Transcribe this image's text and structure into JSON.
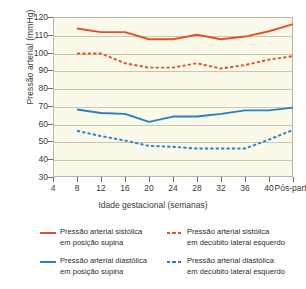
{
  "chart_data": {
    "type": "line",
    "title": "",
    "xlabel": "Idade gestacional (semanas)",
    "ylabel": "Pressão arterial (mmHg)",
    "xlim": [
      4,
      44
    ],
    "ylim": [
      30,
      120
    ],
    "ytick_step": 10,
    "grid": true,
    "legend_position": "bottom",
    "x_tick_labels": [
      "4",
      "8",
      "12",
      "16",
      "20",
      "24",
      "28",
      "32",
      "36",
      "40",
      "Pós-parto"
    ],
    "x_tick_values": [
      4,
      8,
      12,
      16,
      20,
      24,
      28,
      32,
      36,
      40,
      44
    ],
    "y_tick_labels": [
      "120",
      "110",
      "100",
      "90",
      "80",
      "70",
      "60",
      "50",
      "40",
      "30"
    ],
    "y_tick_values": [
      120,
      110,
      100,
      90,
      80,
      70,
      60,
      50,
      40,
      30
    ],
    "x": [
      8,
      12,
      16,
      20,
      24,
      28,
      32,
      36,
      40,
      44
    ],
    "series": [
      {
        "name": "Pressão arterial sistólica em posição supina",
        "name_line1": "Pressão arterial sistólica",
        "name_line2": "em posição supina",
        "color": "#e4502a",
        "style": "solid",
        "values": [
          113.5,
          111.5,
          111.5,
          107.5,
          107.5,
          110,
          107.5,
          109,
          112,
          116
        ]
      },
      {
        "name": "Pressão arterial sistólica em decúbito lateral esquerdo",
        "name_line1": "Pressão arterial sistólica",
        "name_line2": "em decúbito lateral esquerdo",
        "color": "#e4502a",
        "style": "dashed",
        "values": [
          99.5,
          99.5,
          94,
          91.5,
          91.5,
          94,
          91,
          93,
          96,
          98
        ]
      },
      {
        "name": "Pressão arterial diastólica em posição supina",
        "name_line1": "Pressão arterial diastólica",
        "name_line2": "em posição supina",
        "color": "#2a7fc4",
        "style": "solid",
        "values": [
          68,
          66,
          65.5,
          61,
          64,
          64,
          65.5,
          67.5,
          67.5,
          69
        ]
      },
      {
        "name": "Pressão arterial diastólica em decúbito lateral esquerdo",
        "name_line1": "Pressão arterial diastólica",
        "name_line2": "em decúbito lateral esquerdo",
        "color": "#2a7fc4",
        "style": "dashed",
        "values": [
          56,
          53,
          50.5,
          47.5,
          47,
          46,
          46,
          46,
          51,
          56.5
        ]
      }
    ]
  },
  "colors": {
    "systolic": "#e4502a",
    "diastolic": "#2a7fc4",
    "plot_background": "#fbfaea",
    "gridline": "#c9c7b3",
    "axis_text": "#3a3a38"
  }
}
